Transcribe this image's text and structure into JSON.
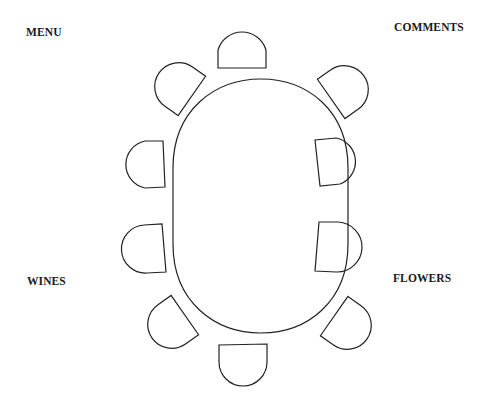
{
  "diagram": {
    "type": "seating-plan",
    "table": {
      "shape": "oval",
      "seats": 10
    },
    "labels": {
      "top_left": "MENU",
      "top_right": "COMMENTS",
      "bottom_left": "WINES",
      "bottom_right": "FLOWERS"
    },
    "colors": {
      "stroke": "#222222",
      "background": "#ffffff",
      "text": "#1a1a1a"
    }
  }
}
